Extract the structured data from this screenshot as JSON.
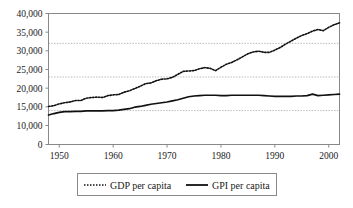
{
  "chart_data": {
    "type": "line",
    "title": "",
    "subtitle": "",
    "xlabel": "",
    "ylabel": "",
    "grid": true,
    "legend_position": "bottom",
    "xlim": [
      1948,
      2002
    ],
    "ylim": [
      0,
      40000
    ],
    "x_ticks": [
      1950,
      1960,
      1970,
      1980,
      1990,
      2000
    ],
    "x_tick_labels": [
      "1950",
      "1960",
      "1970",
      "1980",
      "1990",
      "2000"
    ],
    "y_ticks": [
      0,
      10000,
      15000,
      20000,
      25000,
      30000,
      35000,
      40000
    ],
    "y_tick_labels": [
      "0",
      "10,000",
      "15,000",
      "20,000",
      "25,000",
      "30,000",
      "35,000",
      "40,000"
    ],
    "gridline_values": [
      14000,
      23000,
      32000
    ],
    "x": [
      1948,
      1949,
      1950,
      1951,
      1952,
      1953,
      1954,
      1955,
      1956,
      1957,
      1958,
      1959,
      1960,
      1961,
      1962,
      1963,
      1964,
      1965,
      1966,
      1967,
      1968,
      1969,
      1970,
      1971,
      1972,
      1973,
      1974,
      1975,
      1976,
      1977,
      1978,
      1979,
      1980,
      1981,
      1982,
      1983,
      1984,
      1985,
      1986,
      1987,
      1988,
      1989,
      1990,
      1991,
      1992,
      1993,
      1994,
      1995,
      1996,
      1997,
      1998,
      1999,
      2000,
      2001,
      2002
    ],
    "series": [
      {
        "name": "GDP per capita",
        "style": "dotted",
        "color": "#101010",
        "values": [
          15100,
          15300,
          15800,
          16100,
          16300,
          16700,
          16700,
          17300,
          17500,
          17600,
          17500,
          18000,
          18200,
          18300,
          18900,
          19300,
          19900,
          20500,
          21200,
          21400,
          22000,
          22400,
          22500,
          22900,
          23700,
          24500,
          24600,
          24700,
          25200,
          25500,
          25300,
          24700,
          25600,
          26400,
          26900,
          27600,
          28400,
          29200,
          29700,
          29900,
          29600,
          29600,
          30200,
          30900,
          31800,
          32600,
          33400,
          34100,
          34600,
          35300,
          35700,
          35400,
          36300,
          37000,
          37500
        ]
      },
      {
        "name": "GPI per capita",
        "style": "solid",
        "color": "#101010",
        "values": [
          12800,
          13200,
          13500,
          13700,
          13700,
          13800,
          13800,
          13900,
          13900,
          13900,
          13900,
          14000,
          14000,
          14100,
          14300,
          14500,
          14900,
          15100,
          15400,
          15700,
          15900,
          16100,
          16300,
          16600,
          16900,
          17300,
          17700,
          17900,
          18000,
          18100,
          18100,
          18100,
          18000,
          18000,
          18100,
          18100,
          18100,
          18100,
          18100,
          18100,
          18000,
          17900,
          17800,
          17800,
          17800,
          17800,
          17900,
          17900,
          18000,
          18400,
          18000,
          18100,
          18200,
          18300,
          18400
        ]
      }
    ]
  },
  "legend": {
    "entries": [
      {
        "label": "GDP per capita",
        "style": "dotted"
      },
      {
        "label": "GPI per capita",
        "style": "solid"
      }
    ]
  }
}
